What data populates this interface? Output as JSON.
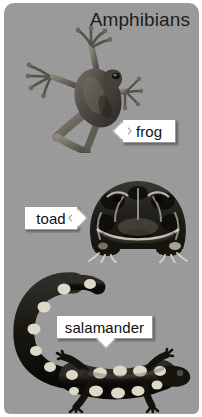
{
  "card": {
    "title": "Amphibians",
    "background_color": "#9b9b9b",
    "corner_radius_px": 10
  },
  "labels": [
    {
      "id": "frog",
      "text": "frog",
      "pointer_direction": "left",
      "box_color": "#ffffff",
      "text_color": "#101010"
    },
    {
      "id": "toad",
      "text": "toad",
      "pointer_direction": "right",
      "box_color": "#ffffff",
      "text_color": "#101010"
    },
    {
      "id": "salamander",
      "text": "salamander",
      "pointer_direction": "down",
      "box_color": "#ffffff",
      "text_color": "#101010"
    }
  ],
  "photos": [
    {
      "id": "frog-photo",
      "subject": "tree frog, top view with splayed legs",
      "style": "grayscale photograph"
    },
    {
      "id": "toad-photo",
      "subject": "horned toad, front view, wide mottled body",
      "style": "grayscale photograph"
    },
    {
      "id": "salamander-photo",
      "subject": "spotted salamander with curled tail",
      "style": "grayscale photograph"
    }
  ]
}
